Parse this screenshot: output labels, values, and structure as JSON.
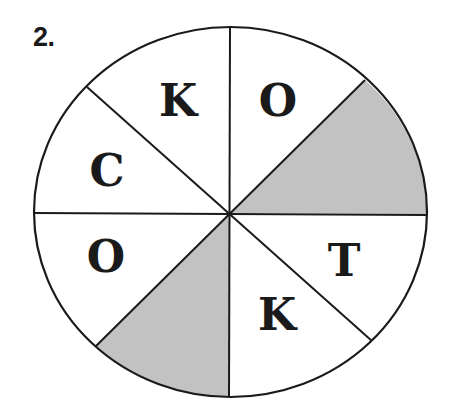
{
  "puzzle": {
    "number_label": "2.",
    "colors": {
      "outline": "#1a1a1a",
      "shaded_fill": "#c2c2c2",
      "background": "#ffffff"
    },
    "circle": {
      "center": [
        230,
        212
      ],
      "rx": 197,
      "ry": 185,
      "divisions": 8
    },
    "sectors": [
      {
        "position": "top-right",
        "letter": "O",
        "shaded": false
      },
      {
        "position": "right-upper",
        "letter": "",
        "shaded": true
      },
      {
        "position": "right-lower",
        "letter": "T",
        "shaded": false
      },
      {
        "position": "bottom-right",
        "letter": "K",
        "shaded": false
      },
      {
        "position": "bottom-left",
        "letter": "",
        "shaded": true
      },
      {
        "position": "left-lower",
        "letter": "O",
        "shaded": false
      },
      {
        "position": "left-upper",
        "letter": "C",
        "shaded": false
      },
      {
        "position": "top-left",
        "letter": "K",
        "shaded": false
      }
    ]
  }
}
